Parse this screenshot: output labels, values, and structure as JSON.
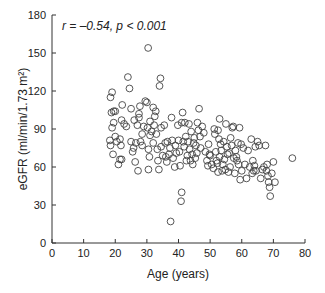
{
  "chart_data": {
    "type": "scatter",
    "title": "",
    "annotation": "r = –0.54, p < 0.001",
    "xlabel": "Age (years)",
    "ylabel": "eGFR (ml/min/1.73 m²)",
    "xlim": [
      0,
      80
    ],
    "ylim": [
      0,
      180
    ],
    "xticks": [
      0,
      10,
      20,
      30,
      40,
      50,
      60,
      70,
      80
    ],
    "yticks": [
      0,
      30,
      60,
      90,
      120,
      150,
      180
    ],
    "grid": false,
    "marker": "open-circle",
    "points": [
      [
        18.5,
        115
      ],
      [
        19,
        119
      ],
      [
        18.8,
        103
      ],
      [
        19.5,
        104
      ],
      [
        20,
        104
      ],
      [
        18.3,
        81
      ],
      [
        18.5,
        77
      ],
      [
        19,
        91
      ],
      [
        19.5,
        95
      ],
      [
        19.3,
        70
      ],
      [
        20,
        84
      ],
      [
        20.5,
        80
      ],
      [
        21,
        62
      ],
      [
        21.5,
        66
      ],
      [
        21.5,
        82
      ],
      [
        21.8,
        77
      ],
      [
        22,
        97
      ],
      [
        22.2,
        109
      ],
      [
        22,
        66
      ],
      [
        22.8,
        94
      ],
      [
        23.5,
        92
      ],
      [
        24,
        131
      ],
      [
        24.5,
        122
      ],
      [
        25,
        106
      ],
      [
        25,
        80
      ],
      [
        25.5,
        72
      ],
      [
        25.8,
        75
      ],
      [
        26,
        97
      ],
      [
        26.3,
        64
      ],
      [
        26.5,
        79
      ],
      [
        27,
        93
      ],
      [
        27.2,
        57
      ],
      [
        27.5,
        99
      ],
      [
        27.5,
        102
      ],
      [
        27.8,
        108
      ],
      [
        28,
        80
      ],
      [
        28.5,
        86
      ],
      [
        28.5,
        77
      ],
      [
        29,
        92
      ],
      [
        29.5,
        112
      ],
      [
        30,
        111
      ],
      [
        30.2,
        91
      ],
      [
        30.4,
        154
      ],
      [
        30.5,
        74
      ],
      [
        30.5,
        58
      ],
      [
        30.8,
        68
      ],
      [
        31,
        96
      ],
      [
        31,
        85
      ],
      [
        31.5,
        88
      ],
      [
        32,
        107
      ],
      [
        32,
        79
      ],
      [
        32.3,
        93
      ],
      [
        32.5,
        100
      ],
      [
        32.8,
        104
      ],
      [
        33,
        86
      ],
      [
        33.3,
        74
      ],
      [
        33.5,
        65
      ],
      [
        33.8,
        58
      ],
      [
        34,
        124
      ],
      [
        34.3,
        130
      ],
      [
        34.5,
        91
      ],
      [
        34.5,
        76
      ],
      [
        35,
        69
      ],
      [
        35.5,
        93
      ],
      [
        35.8,
        79
      ],
      [
        36,
        68
      ],
      [
        36.3,
        64
      ],
      [
        36.5,
        80
      ],
      [
        37,
        70
      ],
      [
        37.3,
        75
      ],
      [
        37.5,
        17
      ],
      [
        37.8,
        99
      ],
      [
        38,
        81
      ],
      [
        38.3,
        67
      ],
      [
        38.8,
        60
      ],
      [
        39,
        77
      ],
      [
        39.3,
        71
      ],
      [
        39.8,
        93
      ],
      [
        40,
        81
      ],
      [
        40.3,
        72
      ],
      [
        40.5,
        61
      ],
      [
        40.8,
        33
      ],
      [
        41,
        40
      ],
      [
        41,
        95
      ],
      [
        41.3,
        103
      ],
      [
        41.5,
        80
      ],
      [
        41.8,
        76
      ],
      [
        42,
        95
      ],
      [
        42.3,
        84
      ],
      [
        42.5,
        65
      ],
      [
        42.8,
        69
      ],
      [
        43,
        80
      ],
      [
        43.3,
        94
      ],
      [
        43.5,
        74
      ],
      [
        43.8,
        65
      ],
      [
        44,
        88
      ],
      [
        44.3,
        70
      ],
      [
        44.5,
        62
      ],
      [
        44.8,
        79
      ],
      [
        45,
        83
      ],
      [
        45.3,
        67
      ],
      [
        45.5,
        77
      ],
      [
        45.8,
        71
      ],
      [
        46,
        95
      ],
      [
        46.3,
        89
      ],
      [
        46.5,
        106
      ],
      [
        46.8,
        84
      ],
      [
        47,
        75
      ],
      [
        47.5,
        92
      ],
      [
        48,
        87
      ],
      [
        48.5,
        72
      ],
      [
        49,
        65
      ],
      [
        49.3,
        61
      ],
      [
        49.5,
        78
      ],
      [
        49.8,
        70
      ],
      [
        50,
        69
      ],
      [
        50.5,
        62
      ],
      [
        51,
        59
      ],
      [
        51.3,
        90
      ],
      [
        51.5,
        86
      ],
      [
        51.8,
        72
      ],
      [
        52,
        65
      ],
      [
        52.3,
        63
      ],
      [
        52.5,
        89
      ],
      [
        52.5,
        56
      ],
      [
        52.8,
        82
      ],
      [
        53,
        98
      ],
      [
        53,
        68
      ],
      [
        53.3,
        78
      ],
      [
        53.5,
        73
      ],
      [
        53.8,
        57
      ],
      [
        54,
        62
      ],
      [
        54.3,
        80
      ],
      [
        54.5,
        66
      ],
      [
        54.8,
        58
      ],
      [
        55,
        94
      ],
      [
        55.3,
        76
      ],
      [
        55.5,
        70
      ],
      [
        55.8,
        56
      ],
      [
        56,
        71
      ],
      [
        56.3,
        60
      ],
      [
        56.5,
        83
      ],
      [
        56.8,
        77
      ],
      [
        57,
        91
      ],
      [
        57.3,
        92
      ],
      [
        57.5,
        67
      ],
      [
        57.8,
        55
      ],
      [
        58,
        73
      ],
      [
        58.3,
        68
      ],
      [
        58.5,
        65
      ],
      [
        58.8,
        79
      ],
      [
        59,
        62
      ],
      [
        59.3,
        91
      ],
      [
        59.5,
        50
      ],
      [
        59.8,
        78
      ],
      [
        60,
        57
      ],
      [
        60.5,
        75
      ],
      [
        61,
        62
      ],
      [
        61.5,
        51
      ],
      [
        62,
        73
      ],
      [
        62.5,
        60
      ],
      [
        63,
        82
      ],
      [
        63.3,
        55
      ],
      [
        63.5,
        65
      ],
      [
        63.8,
        57
      ],
      [
        64,
        61
      ],
      [
        64.3,
        76
      ],
      [
        64.5,
        57
      ],
      [
        65,
        80
      ],
      [
        65.5,
        77
      ],
      [
        66,
        51
      ],
      [
        66.5,
        58
      ],
      [
        67,
        60
      ],
      [
        67.5,
        77
      ],
      [
        67.8,
        57
      ],
      [
        68,
        62
      ],
      [
        68.3,
        53
      ],
      [
        68.5,
        48
      ],
      [
        68.8,
        44
      ],
      [
        69,
        37
      ],
      [
        69.5,
        55
      ],
      [
        70,
        64
      ],
      [
        70.5,
        48
      ],
      [
        76,
        67
      ]
    ]
  }
}
